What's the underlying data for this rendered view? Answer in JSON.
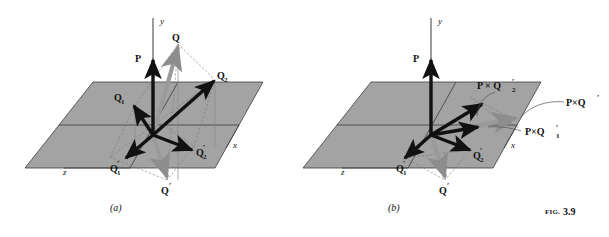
{
  "figure": {
    "caption_prefix": "FIG.",
    "caption_number": "3.9",
    "panel_a_label": "(a)",
    "panel_b_label": "(b)",
    "background_color": "#ffffff",
    "plane_fill_color": "#a3a3a3",
    "plane_edge_color": "#4a4a4a",
    "vector_color": "#111111",
    "ghost_vector_color": "#8d8d8d",
    "dashed_line_color": "#6f6f6f"
  },
  "panel_a": {
    "name": "vector-decomposition-diagram",
    "axes": [
      {
        "id": "y-axis",
        "label": "y"
      },
      {
        "id": "x-axis",
        "label": "x"
      },
      {
        "id": "z-axis",
        "label": "z"
      }
    ],
    "vectors": [
      {
        "id": "P",
        "label": "P",
        "base": "bold-up"
      },
      {
        "id": "Q",
        "label": "Q",
        "base": "above-plane"
      },
      {
        "id": "Q1",
        "label": "Q",
        "sub": "1",
        "prime": ""
      },
      {
        "id": "Q2",
        "label": "Q",
        "sub": "2",
        "prime": ""
      },
      {
        "id": "Q1p",
        "label": "Q",
        "sub": "1",
        "prime": "′"
      },
      {
        "id": "Q2p",
        "label": "Q",
        "sub": "2",
        "prime": "′"
      },
      {
        "id": "Qp",
        "label": "Q",
        "sub": "",
        "prime": "′"
      }
    ],
    "labels": {
      "P": "P",
      "Q": "Q",
      "Q1": "Q",
      "Q1_sub": "1",
      "Q2": "Q",
      "Q2_sub": "2",
      "Q1p": "Q",
      "Q1p_sub": "1",
      "Q1p_prime": "′",
      "Q2p": "Q",
      "Q2p_sub": "2",
      "Q2p_prime": "′",
      "Qp": "Q",
      "Qp_prime": "′",
      "x": "x",
      "y": "y",
      "z": "z"
    }
  },
  "panel_b": {
    "name": "cross-product-diagram",
    "axes": [
      {
        "id": "y-axis",
        "label": "y"
      },
      {
        "id": "x-axis",
        "label": "x"
      },
      {
        "id": "z-axis",
        "label": "z"
      }
    ],
    "labels": {
      "P": "P",
      "PxQ2p": "P × Q",
      "PxQ2p_sub": "2",
      "PxQ2p_prime": "′",
      "PxQp": "P×Q",
      "PxQp_prime": "′",
      "PxQ1p": "P×Q",
      "PxQ1p_sub": "1",
      "PxQ1p_prime": "′",
      "Q1p": "Q",
      "Q1p_sub": "1",
      "Q1p_prime": "′",
      "Q2p": "Q",
      "Q2p_sub": "2",
      "Q2p_prime": "′",
      "Qp": "Q",
      "Qp_prime": "′",
      "x": "x",
      "y": "y",
      "z": "z"
    }
  }
}
